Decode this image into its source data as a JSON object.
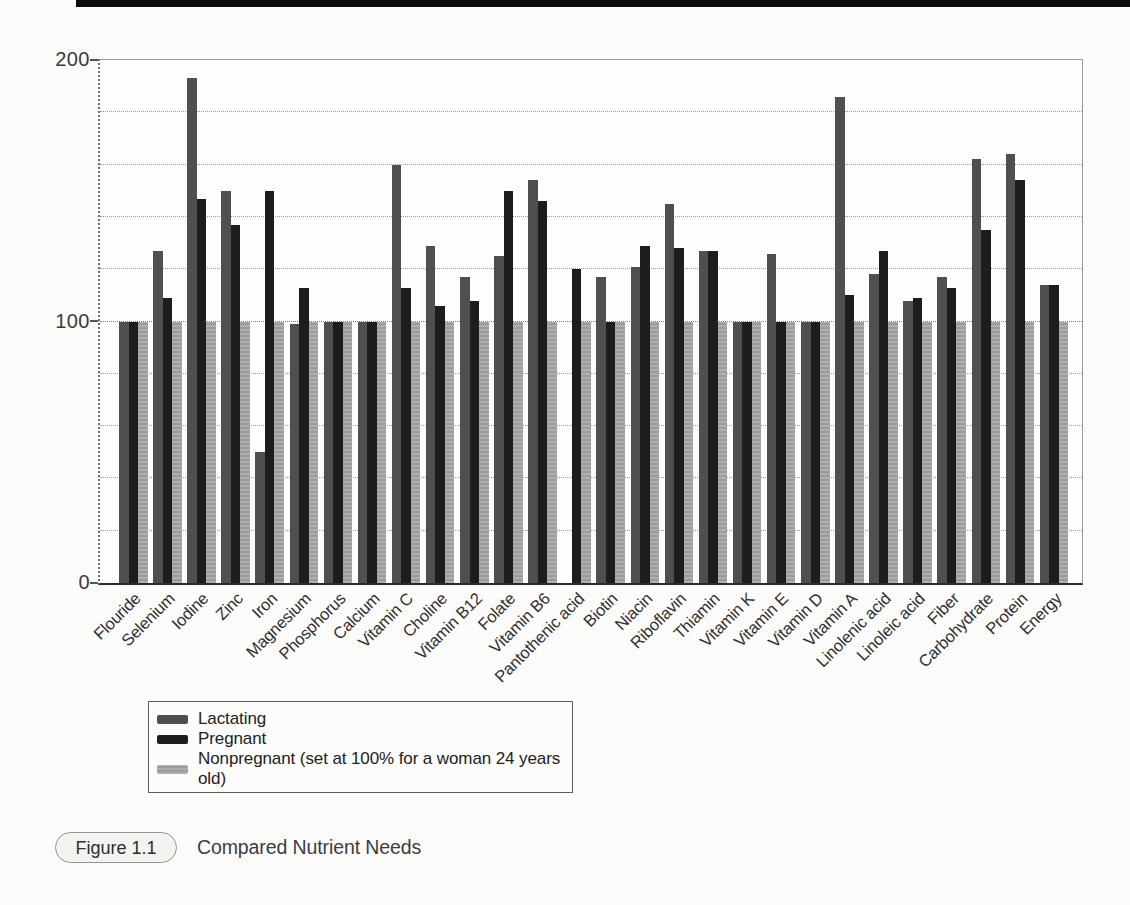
{
  "caption": {
    "label": "Figure 1.1",
    "title": "Compared Nutrient Needs"
  },
  "chart_data": {
    "type": "bar",
    "title": "Compared Nutrient Needs",
    "xlabel": "",
    "ylabel": "",
    "ylim": [
      0,
      200
    ],
    "ytick_interval": 20,
    "ytick_display": [
      "200",
      "100",
      "0"
    ],
    "grid": true,
    "legend_position": "below-left",
    "note": "Nonpregnant series is the 100% reference; Pantothenic acid Lactating bar is not drawn in the source figure",
    "categories": [
      "Flouride",
      "Selenium",
      "Iodine",
      "Zinc",
      "Iron",
      "Magnesium",
      "Phosphorus",
      "Calcium",
      "Vitamin C",
      "Choline",
      "Vitamin B12",
      "Folate",
      "Vitamin B6",
      "Pantothenic acid",
      "Biotin",
      "Niacin",
      "Riboflavin",
      "Thiamin",
      "Vitamin K",
      "Vitamin E",
      "Vitamin D",
      "Vitamin A",
      "Linolenic acid",
      "Linoleic acid",
      "Fiber",
      "Carbohydrate",
      "Protein",
      "Energy"
    ],
    "series": [
      {
        "name": "Lactating",
        "color": "#4f4f4f",
        "values": [
          100,
          127,
          193,
          150,
          50,
          99,
          100,
          100,
          160,
          129,
          117,
          125,
          154,
          null,
          117,
          121,
          145,
          127,
          100,
          126,
          100,
          186,
          118,
          108,
          117,
          162,
          164,
          114
        ]
      },
      {
        "name": "Pregnant",
        "color": "#1d1d1d",
        "values": [
          100,
          109,
          147,
          137,
          150,
          113,
          100,
          100,
          113,
          106,
          108,
          150,
          146,
          120,
          100,
          129,
          128,
          127,
          100,
          100,
          100,
          110,
          127,
          109,
          113,
          135,
          154,
          114
        ]
      },
      {
        "name": "Nonpregnant (set at 100% for a woman 24 years old)",
        "color": "#aeaeae",
        "color2": "#9c9c9c",
        "texture": "dotted",
        "values": [
          100,
          100,
          100,
          100,
          100,
          100,
          100,
          100,
          100,
          100,
          100,
          100,
          100,
          100,
          100,
          100,
          100,
          100,
          100,
          100,
          100,
          100,
          100,
          100,
          100,
          100,
          100,
          100
        ]
      }
    ]
  }
}
